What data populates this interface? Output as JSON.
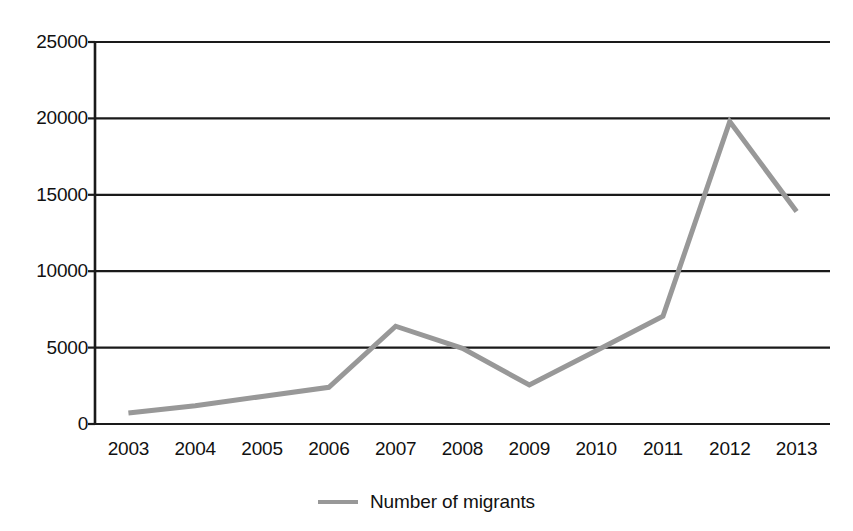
{
  "chart_data": {
    "type": "line",
    "title": "",
    "subtitle": "",
    "xlabel": "",
    "ylabel": "",
    "categories": [
      "2003",
      "2004",
      "2005",
      "2006",
      "2007",
      "2008",
      "2009",
      "2010",
      "2011",
      "2012",
      "2013"
    ],
    "series": [
      {
        "name": "Number of migrants",
        "color": "#989898",
        "values": [
          720,
          1200,
          1800,
          2400,
          6400,
          4950,
          2550,
          4800,
          7050,
          19800,
          13900
        ]
      }
    ],
    "ylim": [
      0,
      25000
    ],
    "yticks": [
      0,
      5000,
      10000,
      15000,
      20000,
      25000
    ],
    "ytick_labels": [
      "0",
      "5000",
      "10000",
      "15000",
      "20000",
      "25000"
    ],
    "grid": "horizontal",
    "grid_color": "#1a1a1a",
    "legend_position": "bottom-center",
    "annotations": []
  },
  "legend": {
    "entry_label": "Number of migrants",
    "swatch_icon": "line-swatch-icon"
  },
  "axes": {
    "y_axis_line_color": "#1a1a1a",
    "x_axis_line_color": "#1a1a1a"
  }
}
